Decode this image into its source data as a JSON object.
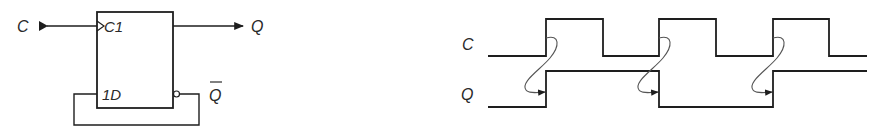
{
  "colors": {
    "ink": "#1e1e1e",
    "curve": "#555555",
    "background": "#ffffff"
  },
  "circuit": {
    "input_label": "C",
    "clock_pin_label": "C1",
    "data_pin_label": "1D",
    "output_label": "Q",
    "inverted_output_label": "Q",
    "inverted_output_overbar": true,
    "feedback": "Q-bar connected back to 1D"
  },
  "timing": {
    "signal_labels": [
      "C",
      "Q"
    ],
    "signals": {
      "C": {
        "initial": 0,
        "transitions_x": [
          546,
          603,
          659,
          716,
          773,
          829
        ]
      },
      "Q": {
        "initial": 0,
        "transitions_x": [
          546,
          659,
          773
        ]
      }
    },
    "causality_arrows": 3
  }
}
